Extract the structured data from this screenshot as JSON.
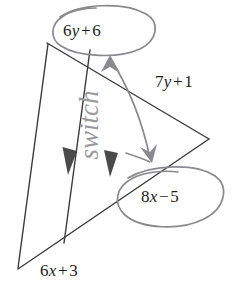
{
  "figure": {
    "type": "geometry-diagram",
    "width": 233,
    "height": 287,
    "background_color": "#ffffff",
    "line_color": "#3a3a3a",
    "annotation_color": "#8e8e93",
    "text_color": "#1d1d1d"
  },
  "labels": {
    "top_angle": {
      "name": "6y + 6",
      "coefficient": "6",
      "variable": "y",
      "operator": "+",
      "constant": "6",
      "circled": true
    },
    "right_side": {
      "name": "7y + 1",
      "coefficient": "7",
      "variable": "y",
      "operator": "+",
      "constant": "1",
      "circled": false
    },
    "lower_angle": {
      "name": "8x - 5",
      "coefficient": "8",
      "variable": "x",
      "operator": "−",
      "constant": "5",
      "circled": true
    },
    "bottom_side": {
      "name": "6x + 3",
      "coefficient": "6",
      "variable": "x",
      "operator": "+",
      "constant": "3",
      "circled": false
    }
  },
  "annotations": {
    "handwritten_note": "switch",
    "handwritten_note_orientation": "rotated-90-ccw",
    "arrow_description": "curved double arrow linking 6y + 6 to 8x - 5",
    "parallel_marks": 2,
    "parallel_mark_direction": "down"
  }
}
